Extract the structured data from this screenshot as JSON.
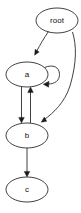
{
  "graph": {
    "title": "root",
    "layout": "top-down directed graph",
    "background_color": "#ffffff",
    "node_stroke_color": "#2b2b2b",
    "edge_color": "#2b2b2b",
    "label_color": "#111111",
    "nodes": [
      {
        "id": "root",
        "label": "root",
        "shape": "ellipse",
        "cx": 57,
        "cy": 20.5,
        "rx": 21,
        "ry": 12.5
      },
      {
        "id": "a",
        "label": "a",
        "shape": "ellipse",
        "cx": 27,
        "cy": 74.5,
        "rx": 21,
        "ry": 12.5
      },
      {
        "id": "b",
        "label": "b",
        "shape": "ellipse",
        "cx": 27,
        "cy": 135.5,
        "rx": 21,
        "ry": 12.5
      },
      {
        "id": "c",
        "label": "c",
        "shape": "ellipse",
        "cx": 27,
        "cy": 189.5,
        "rx": 21,
        "ry": 12.5
      }
    ],
    "edges": [
      {
        "id": "root-a",
        "from": "root",
        "to": "a",
        "directed": true,
        "style": "curved"
      },
      {
        "id": "root-b",
        "from": "root",
        "to": "b",
        "directed": true,
        "style": "long-curve-right"
      },
      {
        "id": "a-b",
        "from": "a",
        "to": "b",
        "directed": true,
        "style": "straight"
      },
      {
        "id": "b-a",
        "from": "b",
        "to": "a",
        "directed": true,
        "style": "straight"
      },
      {
        "id": "a-a",
        "from": "a",
        "to": "a",
        "directed": true,
        "style": "self-loop-right"
      },
      {
        "id": "b-c",
        "from": "b",
        "to": "c",
        "directed": true,
        "style": "straight"
      }
    ]
  }
}
